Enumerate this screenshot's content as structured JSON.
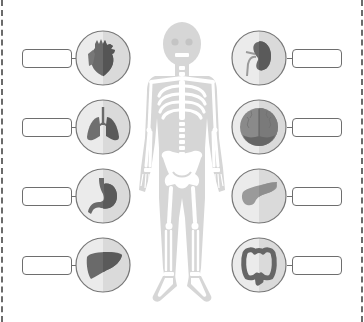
{
  "worksheet": {
    "title": "Human organs labeling worksheet",
    "colors": {
      "border_dash": "#6b6b6b",
      "circle_left_half": "#e9e9e9",
      "circle_right_half": "#d9d9d9",
      "organ_dark": "#6f6f6f",
      "organ_darker": "#5a5a5a",
      "skeleton_body": "#d4d4d4",
      "skeleton_bone": "#ffffff"
    },
    "left_organs": [
      {
        "name": "heart",
        "icon": "heart-icon",
        "label": ""
      },
      {
        "name": "lungs",
        "icon": "lungs-icon",
        "label": ""
      },
      {
        "name": "stomach",
        "icon": "stomach-icon",
        "label": ""
      },
      {
        "name": "liver",
        "icon": "liver-icon",
        "label": ""
      }
    ],
    "right_organs": [
      {
        "name": "kidney",
        "icon": "kidney-icon",
        "label": ""
      },
      {
        "name": "brain",
        "icon": "brain-icon",
        "label": ""
      },
      {
        "name": "pancreas",
        "icon": "pancreas-icon",
        "label": ""
      },
      {
        "name": "intestine",
        "icon": "intestine-icon",
        "label": ""
      }
    ],
    "center_figure": "skeleton-figure"
  }
}
